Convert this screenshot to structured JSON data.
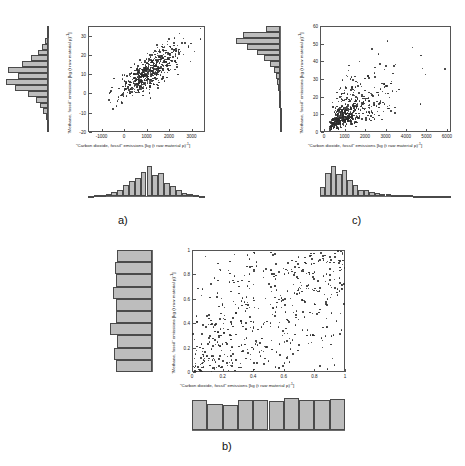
{
  "figure": {
    "panels": [
      {
        "caption": "a)",
        "xlabel": "\"Carbon dioxide, fossil\" emissions [kg (t raw material p)",
        "xlabel_sup": "-1",
        "xlabel_tail": "]",
        "ylabel": "\"Methane, fossil\" emissions [kg (t raw material p)",
        "ylabel_sup": "-1",
        "ylabel_tail": "]"
      },
      {
        "caption": "b)",
        "xlabel": "\"Carbon dioxide, fossil\" emissions [kg (t raw material p)",
        "xlabel_sup": "-1",
        "xlabel_tail": "]",
        "ylabel": "\"Methane, fossil\" emissions [kg (t raw material p)",
        "ylabel_sup": "-1",
        "ylabel_tail": "]"
      },
      {
        "caption": "c)",
        "xlabel": "\"Carbon dioxide, fossil\" emissions [kg (t raw material p)",
        "xlabel_sup": "-1",
        "xlabel_tail": "]",
        "ylabel": "\"Methane, fossil\" emissions [kg (t raw material p)",
        "ylabel_sup": "-1",
        "ylabel_tail": "]"
      }
    ]
  },
  "chart_data": [
    {
      "panel": "a",
      "type": "scatter",
      "title": "",
      "xlabel": "\"Carbon dioxide, fossil\" emissions [kg (t raw material p)-1]",
      "ylabel": "\"Methane, fossil\" emissions [kg (t raw material p)-1]",
      "xlim": [
        -1600,
        3600
      ],
      "ylim": [
        -20,
        35
      ],
      "xticks": [
        -1000,
        0,
        1000,
        2000,
        3000
      ],
      "yticks": [
        -20,
        -10,
        0,
        10,
        20,
        30
      ],
      "grid": false,
      "legend": "none",
      "n_points": 520,
      "correlation": 0.78,
      "marginal_x": {
        "type": "bar",
        "orientation": "vertical",
        "description": "approximately normal distribution of carbon dioxide values",
        "values": [
          1,
          2,
          3,
          5,
          9,
          16,
          26,
          38,
          44,
          60,
          74,
          52,
          56,
          33,
          24,
          14,
          8,
          4,
          2,
          1
        ]
      },
      "marginal_y": {
        "type": "bar",
        "orientation": "horizontal",
        "description": "approximately normal distribution of methane values",
        "values": [
          1,
          2,
          4,
          8,
          14,
          22,
          36,
          58,
          74,
          52,
          70,
          46,
          30,
          18,
          10,
          5,
          2,
          1
        ]
      }
    },
    {
      "panel": "b",
      "type": "scatter",
      "title": "",
      "xlabel": "\"Carbon dioxide, fossil\" emissions [kg (t raw material p)-1]",
      "ylabel": "\"Methane, fossil\" emissions [kg (t raw material p)-1]",
      "xlim": [
        0,
        1
      ],
      "ylim": [
        0,
        1
      ],
      "xticks": [
        0,
        0.2,
        0.4,
        0.6,
        0.8,
        1
      ],
      "yticks": [
        0,
        0.2,
        0.4,
        0.6,
        0.8,
        1
      ],
      "grid": false,
      "legend": "none",
      "n_points": 520,
      "correlation": 0.55,
      "marginal_x": {
        "type": "bar",
        "orientation": "vertical",
        "description": "approximately uniform distribution of rank-transformed values",
        "values": [
          52,
          46,
          44,
          52,
          52,
          50,
          56,
          52,
          52,
          55
        ]
      },
      "marginal_y": {
        "type": "bar",
        "orientation": "horizontal",
        "description": "approximately uniform distribution of rank-transformed values",
        "values": [
          50,
          52,
          49,
          58,
          50,
          50,
          54,
          50,
          51,
          49
        ]
      }
    },
    {
      "panel": "c",
      "type": "scatter",
      "title": "",
      "xlabel": "\"Carbon dioxide, fossil\" emissions [kg (t raw material p)-1]",
      "ylabel": "\"Methane, fossil\" emissions [kg (t raw material p)-1]",
      "xlim": [
        -200,
        6200
      ],
      "ylim": [
        0,
        60
      ],
      "xticks": [
        0,
        1000,
        2000,
        3000,
        4000,
        5000,
        6000
      ],
      "yticks": [
        0,
        10,
        20,
        30,
        40,
        50,
        60
      ],
      "grid": false,
      "legend": "none",
      "n_points": 520,
      "correlation": 0.62,
      "marginal_x": {
        "type": "bar",
        "orientation": "vertical",
        "description": "right-skewed distribution of carbon dioxide values with long tail",
        "values": [
          30,
          74,
          96,
          70,
          82,
          50,
          34,
          20,
          18,
          14,
          9,
          7,
          5,
          4,
          3,
          2,
          2,
          1,
          1,
          1,
          1,
          1,
          0,
          1
        ]
      },
      "marginal_y": {
        "type": "bar",
        "orientation": "horizontal",
        "description": "right-skewed distribution of methane values with long tail",
        "values": [
          1,
          1,
          1,
          1,
          2,
          2,
          3,
          4,
          6,
          9,
          14,
          22,
          34,
          50,
          72,
          96,
          80,
          30
        ]
      }
    }
  ]
}
